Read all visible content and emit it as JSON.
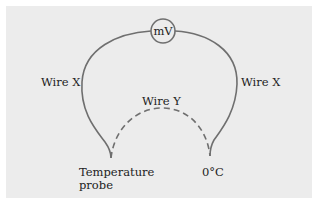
{
  "diagram": {
    "meter": {
      "label": "mV"
    },
    "wires": [
      {
        "id": "left",
        "label": "Wire X",
        "style": "solid"
      },
      {
        "id": "right",
        "label": "Wire X",
        "style": "solid"
      },
      {
        "id": "bottom",
        "label": "Wire Y",
        "style": "dashed"
      }
    ],
    "junctions": {
      "probe_line1": "Temperature",
      "probe_line2": "probe",
      "reference": "0°C"
    },
    "colors": {
      "background": "#ececec",
      "wire": "#6f6f6f",
      "text": "#222222"
    }
  }
}
